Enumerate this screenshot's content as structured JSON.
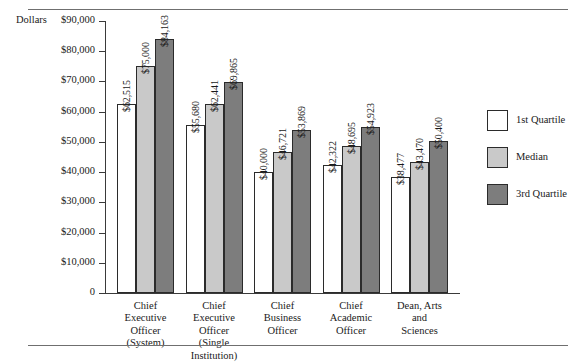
{
  "page": {
    "dollars_axis_caption": "Dollars",
    "cropped_title_fragment": ""
  },
  "legend": {
    "position": "right",
    "items": [
      {
        "label": "1st Quartile",
        "swatch": "white",
        "color": "#ffffff"
      },
      {
        "label": "Median",
        "swatch": "light-gray",
        "color": "#c9c9c9"
      },
      {
        "label": "3rd Quartile",
        "swatch": "dark-gray",
        "color": "#7d7d7d"
      }
    ]
  },
  "chart_data": {
    "type": "bar",
    "title": "",
    "xlabel": "",
    "ylabel": "Dollars",
    "ylim": [
      0,
      90000
    ],
    "ytick_labels": [
      "$90,000",
      "$80,000",
      "$70,000",
      "$60,000",
      "$50,000",
      "$40,000",
      "$30,000",
      "$20,000",
      "$10,000",
      "0"
    ],
    "ytick_values": [
      90000,
      80000,
      70000,
      60000,
      50000,
      40000,
      30000,
      20000,
      10000,
      0
    ],
    "grid": false,
    "legend_position": "right",
    "categories": [
      "Chief Executive Officer (System)",
      "Chief Executive Officer (Single Institution)",
      "Chief Business Officer",
      "Chief Academic Officer",
      "Dean, Arts and Sciences"
    ],
    "category_lines": [
      [
        "Chief",
        "Executive",
        "Officer",
        "(System)"
      ],
      [
        "Chief",
        "Executive",
        "Officer",
        "(Single",
        "Institution)"
      ],
      [
        "Chief",
        "Business",
        "Officer"
      ],
      [
        "Chief",
        "Academic",
        "Officer"
      ],
      [
        "Dean, Arts",
        "and",
        "Sciences"
      ]
    ],
    "series": [
      {
        "name": "1st Quartile",
        "color": "#ffffff",
        "values": [
          62515,
          55680,
          40000,
          42322,
          38477
        ],
        "labels": [
          "$62,515",
          "$55,680",
          "$40,000",
          "$42,322",
          "$38,477"
        ]
      },
      {
        "name": "Median",
        "color": "#c9c9c9",
        "values": [
          75000,
          62441,
          46721,
          48695,
          43470
        ],
        "labels": [
          "$75,000",
          "$62,441",
          "$46,721",
          "$48,695",
          "$43,470"
        ]
      },
      {
        "name": "3rd Quartile",
        "color": "#7d7d7d",
        "values": [
          84163,
          69865,
          53869,
          54923,
          50400
        ],
        "labels": [
          "$84,163",
          "$69,865",
          "$53,869",
          "$54,923",
          "$50,400"
        ]
      }
    ]
  }
}
